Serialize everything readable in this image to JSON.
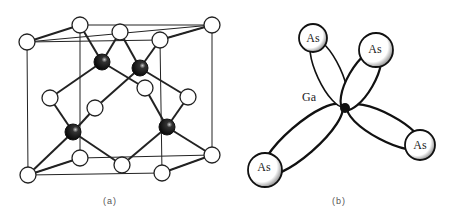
{
  "figure": {
    "panel_a": {
      "caption": "(a)",
      "description": "Zincblende unit cell",
      "white_atoms": [
        [
          27,
          42
        ],
        [
          80,
          25
        ],
        [
          120,
          32
        ],
        [
          160,
          40
        ],
        [
          212,
          25
        ],
        [
          50,
          98
        ],
        [
          95,
          108
        ],
        [
          145,
          88
        ],
        [
          188,
          97
        ],
        [
          80,
          158
        ],
        [
          122,
          165
        ],
        [
          28,
          175
        ],
        [
          162,
          173
        ],
        [
          212,
          155
        ]
      ],
      "black_atoms": [
        [
          102,
          62
        ],
        [
          140,
          68
        ],
        [
          73,
          132
        ],
        [
          167,
          127
        ]
      ],
      "colors": {
        "white_atom_fill": "#ffffff",
        "black_atom_fill": "#111111",
        "line": "#222222"
      }
    },
    "panel_b": {
      "caption": "(b)",
      "center_label": "Ga",
      "center": [
        345,
        108
      ],
      "neighbors": [
        {
          "label": "As",
          "pos": [
            313,
            38
          ],
          "r": 14
        },
        {
          "label": "As",
          "pos": [
            376,
            50
          ],
          "r": 17
        },
        {
          "label": "As",
          "pos": [
            265,
            170
          ],
          "r": 17
        },
        {
          "label": "As",
          "pos": [
            420,
            145
          ],
          "r": 15
        }
      ]
    }
  }
}
